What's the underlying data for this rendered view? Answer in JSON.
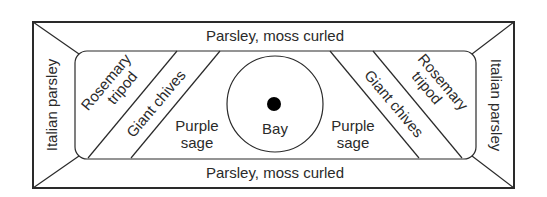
{
  "diagram": {
    "type": "garden-bed-planting-plan",
    "outer_border": {
      "top": "Parsley, moss curled",
      "bottom": "Parsley, moss curled",
      "left": "Italian parsley",
      "right": "Italian parsley"
    },
    "inner_bed": {
      "left_strips": [
        "Rosemary tripod",
        "Giant chives"
      ],
      "left_strip_lines": {
        "rosemary": [
          "Rosemary",
          "tripod"
        ],
        "chives": "Giant chives"
      },
      "left_center": [
        "Purple",
        "sage"
      ],
      "center": "Bay",
      "right_center": [
        "Purple",
        "sage"
      ],
      "right_strips": [
        "Giant chives",
        "Rosemary tripod"
      ],
      "right_strip_lines": {
        "rosemary": [
          "Rosemary",
          "tripod"
        ],
        "chives": "Giant chives"
      }
    },
    "colors": {
      "line": "#2a2a2a",
      "background": "#ffffff",
      "bay_dot": "#000000"
    }
  }
}
